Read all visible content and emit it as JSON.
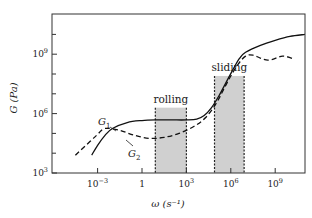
{
  "chart_data": {
    "type": "line",
    "title": "",
    "xlabel": "ω (s⁻¹)",
    "ylabel": "G (Pa)",
    "xscale": "log",
    "yscale": "log",
    "xlim_exp": [
      -6,
      11.5
    ],
    "ylim_exp": [
      3,
      11
    ],
    "x_ticks": [
      {
        "exp": -3,
        "label": "10",
        "sup": "−3"
      },
      {
        "exp": 0,
        "label": "1",
        "sup": ""
      },
      {
        "exp": 3,
        "label": "10",
        "sup": "3"
      },
      {
        "exp": 6,
        "label": "10",
        "sup": "6"
      },
      {
        "exp": 9,
        "label": "10",
        "sup": "9"
      }
    ],
    "y_ticks": [
      {
        "exp": 3,
        "label": "10",
        "sup": "3"
      },
      {
        "exp": 6,
        "label": "10",
        "sup": "6"
      },
      {
        "exp": 9,
        "label": "10",
        "sup": "9"
      }
    ],
    "y_minor_ticks_exp": [
      4,
      5,
      7,
      8,
      10
    ],
    "grid": false,
    "legend": "inline labels",
    "regions": [
      {
        "name": "rolling",
        "x_from_exp": 0.9,
        "x_to_exp": 3.0,
        "top_exp": 6.3,
        "color": "#c8c8c8"
      },
      {
        "name": "sliding",
        "x_from_exp": 4.9,
        "x_to_exp": 6.9,
        "top_exp": 7.9,
        "color": "#c8c8c8"
      }
    ],
    "series": [
      {
        "name": "G1",
        "label_main": "G",
        "label_sub": "1",
        "style": "solid",
        "points_exp": [
          [
            -3.4,
            3.9
          ],
          [
            -3.0,
            4.4
          ],
          [
            -2.5,
            4.9
          ],
          [
            -2.0,
            5.25
          ],
          [
            -1.0,
            5.55
          ],
          [
            0.0,
            5.65
          ],
          [
            1.0,
            5.68
          ],
          [
            2.0,
            5.68
          ],
          [
            3.0,
            5.68
          ],
          [
            3.7,
            5.72
          ],
          [
            4.2,
            5.9
          ],
          [
            4.7,
            6.3
          ],
          [
            5.2,
            6.9
          ],
          [
            5.7,
            7.6
          ],
          [
            6.2,
            8.3
          ],
          [
            6.6,
            8.8
          ],
          [
            7.0,
            9.1
          ],
          [
            8.0,
            9.45
          ],
          [
            9.0,
            9.7
          ],
          [
            10.0,
            9.9
          ],
          [
            11.0,
            10.0
          ]
        ]
      },
      {
        "name": "G2",
        "label_main": "G",
        "label_sub": "2",
        "style": "dashed",
        "points_exp": [
          [
            -4.5,
            3.9
          ],
          [
            -3.5,
            4.6
          ],
          [
            -3.0,
            4.95
          ],
          [
            -2.5,
            5.25
          ],
          [
            -1.5,
            5.15
          ],
          [
            -0.5,
            4.9
          ],
          [
            0.5,
            4.75
          ],
          [
            1.5,
            4.8
          ],
          [
            2.5,
            5.0
          ],
          [
            3.5,
            5.35
          ],
          [
            4.3,
            5.8
          ],
          [
            5.0,
            6.5
          ],
          [
            5.5,
            7.2
          ],
          [
            6.0,
            7.9
          ],
          [
            6.5,
            8.5
          ],
          [
            7.0,
            8.9
          ],
          [
            7.5,
            8.95
          ],
          [
            8.5,
            8.7
          ],
          [
            9.5,
            8.9
          ],
          [
            10.3,
            8.75
          ]
        ]
      }
    ]
  }
}
